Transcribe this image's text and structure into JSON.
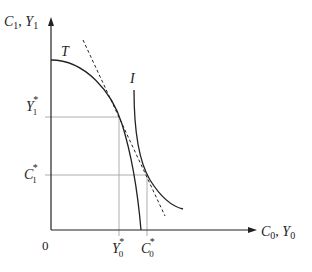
{
  "diagram": {
    "type": "economics-intertemporal-choice",
    "axes": {
      "y_label_main": "C",
      "y_label_sub1": "1",
      "y_label_sep": ", ",
      "y_label_main2": "Y",
      "y_label_sub2": "1",
      "x_label_main": "C",
      "x_label_sub1": "0",
      "x_label_sep": ", ",
      "x_label_main2": "Y",
      "x_label_sub2": "0",
      "origin": "0"
    },
    "curves": {
      "transformation_curve_label": "T",
      "indifference_curve_label": "I",
      "tangent_line": "dashed budget line"
    },
    "y_ticks": [
      {
        "main": "Y",
        "sub": "1",
        "sup": "*"
      },
      {
        "main": "C",
        "sub": "1",
        "sup": "*"
      }
    ],
    "x_ticks": [
      {
        "main": "Y",
        "sub": "0",
        "sup": "*"
      },
      {
        "main": "C",
        "sub": "0",
        "sup": "*"
      }
    ],
    "colors": {
      "axis": "#222222",
      "curve": "#222222",
      "guide": "#999999"
    }
  }
}
